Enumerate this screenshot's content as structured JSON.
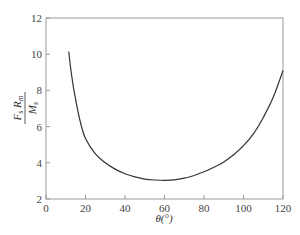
{
  "chart_data": {
    "type": "line",
    "title": "",
    "xlabel": "θ(°)",
    "ylabel": {
      "numerator": "F_s R_m",
      "denominator": "M_s"
    },
    "xlim": [
      0,
      120
    ],
    "ylim": [
      2,
      12
    ],
    "xticks": [
      0,
      20,
      40,
      60,
      80,
      100,
      120
    ],
    "yticks": [
      2,
      4,
      6,
      8,
      10,
      12
    ],
    "grid": false,
    "legend": null,
    "series": [
      {
        "name": "F_s R_m / M_s",
        "x": [
          11.5,
          13,
          15,
          17.5,
          20,
          25,
          30,
          35,
          40,
          45,
          50,
          55,
          60,
          65,
          70,
          75,
          80,
          85,
          90,
          95,
          100,
          105,
          110,
          115,
          120
        ],
        "y": [
          10.15,
          8.8,
          7.5,
          6.2,
          5.35,
          4.5,
          4.0,
          3.65,
          3.4,
          3.22,
          3.1,
          3.05,
          3.03,
          3.06,
          3.15,
          3.3,
          3.5,
          3.75,
          4.05,
          4.45,
          4.95,
          5.6,
          6.5,
          7.6,
          9.1
        ]
      }
    ]
  },
  "labels": {
    "x_axis": "θ(°)",
    "y_num_a": "F",
    "y_num_a_sub": "s",
    "y_num_b": "R",
    "y_num_b_sub": "m",
    "y_den": "M",
    "y_den_sub": "s"
  }
}
